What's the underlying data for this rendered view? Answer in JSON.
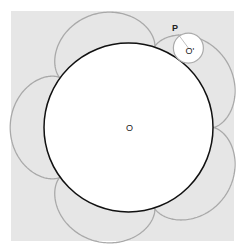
{
  "diagram": {
    "type": "epicycloid-construction",
    "background": {
      "x": 11,
      "y": 11,
      "width": 223,
      "height": 230,
      "color": "#e6e6e6"
    },
    "fixed_circle": {
      "label": "O",
      "cx": 128.5,
      "cy": 127.5,
      "r": 84.5,
      "stroke": "#111111",
      "fill": "#ffffff",
      "label_x": 126,
      "label_y": 131
    },
    "epicycloid": {
      "cusps": 5,
      "stroke": "#a9a9a9",
      "start_angle_deg": 0
    },
    "rolling_circle": {
      "label": "O'",
      "angle_deg": 53,
      "r": 15,
      "stroke": "#aaaaaa",
      "fill": "#ffffff",
      "label_dx": 3,
      "label_dy": 6
    },
    "point": {
      "label": "P",
      "x": 178,
      "y": 34,
      "label_x": 172,
      "label_y": 31
    }
  }
}
